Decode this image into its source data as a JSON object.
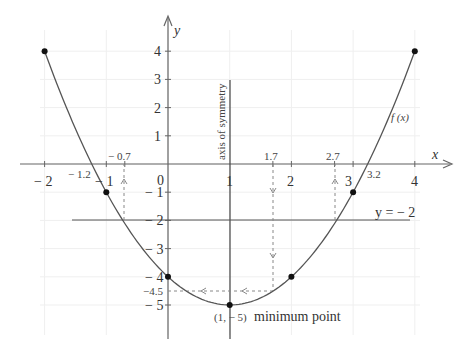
{
  "chart_data": {
    "type": "line",
    "title": "",
    "function_label": "f(x)",
    "equation": "f(x) = x^2 - 2x - 4",
    "xlabel": "x",
    "ylabel": "y",
    "xlim": [
      -2,
      4
    ],
    "ylim": [
      -5,
      4
    ],
    "grid": true,
    "x_ticks": [
      -2,
      -1,
      0,
      1,
      2,
      3,
      4
    ],
    "y_ticks": [
      4,
      3,
      2,
      1,
      -1,
      -2,
      -3,
      -4,
      -5
    ],
    "points": [
      {
        "x": -2,
        "y": 4
      },
      {
        "x": -1,
        "y": -1
      },
      {
        "x": 0,
        "y": -4
      },
      {
        "x": 1,
        "y": -5
      },
      {
        "x": 2,
        "y": -4
      },
      {
        "x": 3,
        "y": -1
      },
      {
        "x": 4,
        "y": 4
      }
    ],
    "annotations": {
      "axis_of_symmetry": "axis of symmetry",
      "axis_of_symmetry_x": 1,
      "minimum_point_coords": "(1, − 5)",
      "minimum_point_text": "minimum point",
      "horizontal_line_label": "y = − 2",
      "horizontal_line_y": -2,
      "root_left": "− 1.2",
      "root_right": "3.2",
      "x_at_y_minus2_left": "− 0.7",
      "x_at_y_minus2_right": "2.7",
      "x_at_y_minus4_5": "1.7",
      "y_value_label": "−4.5"
    }
  },
  "labels": {
    "x_axis": "x",
    "y_axis": "y",
    "origin": "0",
    "x_ticks": [
      "− 2",
      "− 1",
      "1",
      "2",
      "3",
      "4"
    ],
    "y_ticks": [
      "4",
      "3",
      "2",
      "1",
      "− 1",
      "− 2",
      "− 3",
      "− 4",
      "− 5"
    ],
    "y_minus_4_5": "−4.5",
    "f_label": "f (x)",
    "axis_sym": "axis of symmetry",
    "min_coords": "(1, − 5)",
    "min_text": "minimum point",
    "hline": "y = − 2",
    "root_left": "− 1.2",
    "root_right": "3.2",
    "neg07": "− 0.7",
    "v17": "1.7",
    "v27": "2.7"
  },
  "colors": {
    "curve": "#555555",
    "axis": "#666666",
    "grid": "#eeeeee",
    "point": "#111111",
    "dash": "#888888"
  }
}
